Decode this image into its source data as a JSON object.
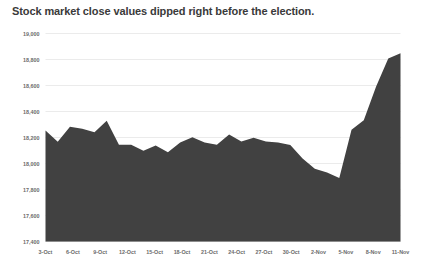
{
  "chart_data": {
    "type": "area",
    "title": "Stock market close values dipped right before the election.",
    "xlabel": "",
    "ylabel": "",
    "ylim": [
      17400,
      19000
    ],
    "grid": true,
    "legend": "none",
    "fill_color": "#414141",
    "gridline_color": "#e3e3e3",
    "tick_label_color": "#6b6b6b",
    "title_color": "#3a3a3a",
    "yticks": [
      17400,
      17600,
      17800,
      18000,
      18200,
      18400,
      18600,
      18800,
      19000
    ],
    "ytick_labels": [
      "17,400",
      "17,600",
      "17,800",
      "18,000",
      "18,200",
      "18,400",
      "18,600",
      "18,800",
      "19,000"
    ],
    "xtick_labels": [
      "3-Oct",
      "6-Oct",
      "9-Oct",
      "12-Oct",
      "15-Oct",
      "18-Oct",
      "21-Oct",
      "24-Oct",
      "27-Oct",
      "30-Oct",
      "2-Nov",
      "5-Nov",
      "8-Nov",
      "11-Nov"
    ],
    "x": [
      "3-Oct",
      "4-Oct",
      "5-Oct",
      "6-Oct",
      "7-Oct",
      "10-Oct",
      "11-Oct",
      "12-Oct",
      "13-Oct",
      "14-Oct",
      "17-Oct",
      "18-Oct",
      "19-Oct",
      "20-Oct",
      "21-Oct",
      "24-Oct",
      "25-Oct",
      "26-Oct",
      "27-Oct",
      "28-Oct",
      "31-Oct",
      "1-Nov",
      "2-Nov",
      "3-Nov",
      "4-Nov",
      "7-Nov",
      "8-Nov",
      "9-Nov",
      "10-Nov",
      "11-Nov"
    ],
    "values": [
      18253,
      18168,
      18282,
      18268,
      18240,
      18329,
      18144,
      18145,
      18099,
      18138,
      18087,
      18161,
      18202,
      18162,
      18145,
      18223,
      18169,
      18199,
      18170,
      18161,
      18142,
      18038,
      17960,
      17930,
      17888,
      18259,
      18333,
      18590,
      18807,
      18848
    ],
    "series": [
      {
        "name": "Stock market close value",
        "values": [
          18253,
          18168,
          18282,
          18268,
          18240,
          18329,
          18144,
          18145,
          18099,
          18138,
          18087,
          18161,
          18202,
          18162,
          18145,
          18223,
          18169,
          18199,
          18170,
          18161,
          18142,
          18038,
          17960,
          17930,
          17888,
          18259,
          18333,
          18590,
          18807,
          18848
        ]
      }
    ]
  }
}
